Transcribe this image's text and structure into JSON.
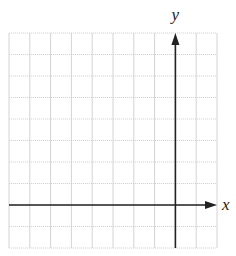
{
  "diagram": {
    "type": "coordinate-grid",
    "grid": {
      "columns": 10,
      "rows": 10,
      "left": 9,
      "top": 33,
      "cell_width": 20.8,
      "cell_height": 21.5,
      "line_color": "#cfcfcf"
    },
    "axes": {
      "color": "#222222",
      "y_axis_column_index": 8,
      "x_axis_row_index": 8,
      "x_label": "x",
      "y_label": "y"
    }
  }
}
